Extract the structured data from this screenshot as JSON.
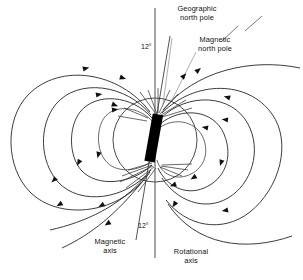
{
  "diagram": {
    "background": "#ffffff",
    "stroke_color": "#1a1a1a",
    "magnet_color": "#000000",
    "labels": {
      "geographic_north_pole": "Geographic\nnorth pole",
      "magnetic_north_pole": "Magnetic\nnorth pole",
      "magnetic_axis": "Magnetic\naxis",
      "rotational_axis": "Rotational\naxis",
      "angle_top": "12°",
      "angle_bottom": "12°"
    },
    "elements": {
      "earth_circle": "earth-outline",
      "bar_magnet": "bar-magnet",
      "rotational_axis_line": "rotational-axis-line",
      "magnetic_axis_line": "magnetic-axis-line",
      "field_lines": "magnetic-field-lines",
      "arrowheads": "field-direction-arrows"
    },
    "tilt_degrees": 12
  }
}
